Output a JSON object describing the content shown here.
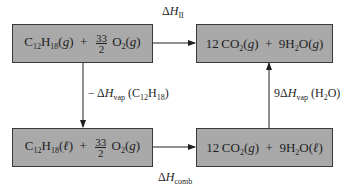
{
  "diagram": {
    "type": "thermochemical-cycle",
    "boxes": {
      "top_left": {
        "species": "C12H18",
        "species_sub": [
          "12",
          "18"
        ],
        "state": "g",
        "plus": "+",
        "coef_num": "33",
        "coef_den": "2",
        "reactant2": "O",
        "reactant2_sub": "2",
        "reactant2_state": "g",
        "text": "C12H18(g) + 33/2 O2(g)"
      },
      "top_right": {
        "coef1": "12",
        "product1": "CO",
        "product1_sub": "2",
        "product1_state": "g",
        "plus": "+",
        "coef2": "9",
        "product2_a": "H",
        "product2_sub": "2",
        "product2_b": "O",
        "product2_state": "g",
        "text": "12 CO2(g) + 9H2O(g)"
      },
      "bottom_left": {
        "species": "C12H18",
        "species_sub": [
          "12",
          "18"
        ],
        "state": "ℓ",
        "plus": "+",
        "coef_num": "33",
        "coef_den": "2",
        "reactant2": "O",
        "reactant2_sub": "2",
        "reactant2_state": "g",
        "text": "C12H18(ℓ) + 33/2 O2(g)"
      },
      "bottom_right": {
        "coef1": "12",
        "product1": "CO",
        "product1_sub": "2",
        "product1_state": "g",
        "plus": "+",
        "coef2": "9",
        "product2_a": "H",
        "product2_sub": "2",
        "product2_b": "O",
        "product2_state": "ℓ",
        "text": "12 CO2(g) + 9H2O(ℓ)"
      }
    },
    "arrows": {
      "top": {
        "delta": "Δ",
        "symbol": "H",
        "subscript": "II",
        "text": "ΔH_II",
        "direction": "top_left→top_right"
      },
      "bottom": {
        "delta": "Δ",
        "symbol": "H",
        "subscript": "comb",
        "text": "ΔH_comb",
        "direction": "bottom_left→bottom_right"
      },
      "left": {
        "prefix": "− Δ",
        "symbol": "H",
        "subscript": "vap",
        "paren_open": "(C",
        "sub1": "12",
        "mid": "H",
        "sub2": "18",
        "paren_close": ")",
        "text": "−ΔH_vap (C12H18)",
        "direction": "top_left→bottom_left"
      },
      "right": {
        "prefix": "9Δ",
        "symbol": "H",
        "subscript": "vap",
        "paren_open": "(H",
        "sub1": "2",
        "paren_close": "O)",
        "text": "9ΔH_vap (H2O)",
        "direction": "bottom_right→top_right"
      }
    },
    "colors": {
      "box_fill": "#a9a9a9",
      "box_border": "#3a3a3a",
      "line": "#1e1e1e",
      "background": "#ffffff"
    }
  }
}
